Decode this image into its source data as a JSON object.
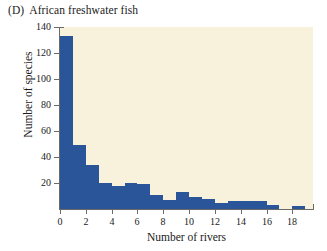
{
  "figure": {
    "panel_letter": "(D)",
    "panel_title": "African freshwater fish",
    "background_color": "#ffffff",
    "plot_background_color": "#f8f2dc",
    "bar_color": "#2a5699",
    "axis_color": "#6a6a66"
  },
  "chart_data": {
    "type": "bar",
    "xlabel": "Number of rivers",
    "ylabel": "Number of species",
    "xlim": [
      0,
      19.6
    ],
    "ylim": [
      0,
      140
    ],
    "grid": false,
    "legend": null,
    "bin_width": 1,
    "categories": [
      "0",
      "1",
      "2",
      "3",
      "4",
      "5",
      "6",
      "7",
      "8",
      "9",
      "10",
      "11",
      "12",
      "13",
      "14",
      "15",
      "16",
      "17",
      "18"
    ],
    "bin_starts": [
      0,
      1,
      2,
      3,
      4,
      5,
      6,
      7,
      8,
      9,
      10,
      11,
      12,
      13,
      14,
      15,
      16,
      17,
      18
    ],
    "values": [
      133,
      49,
      34,
      20,
      18,
      20,
      19,
      11,
      7,
      13,
      9,
      8,
      5,
      6,
      6,
      6,
      3,
      0,
      2
    ],
    "xticks": [
      0,
      2,
      4,
      6,
      8,
      10,
      12,
      14,
      16,
      18
    ],
    "xtick_labels": [
      "0",
      "2",
      "4",
      "6",
      "8",
      "10",
      "12",
      "14",
      "16",
      "18"
    ],
    "yticks": [
      20,
      40,
      60,
      80,
      100,
      120,
      140
    ],
    "ytick_labels": [
      "20",
      "40",
      "60",
      "80",
      "100",
      "120",
      "140"
    ]
  }
}
